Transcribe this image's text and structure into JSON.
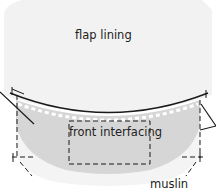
{
  "diagram": {
    "type": "sewing-pattern-illustration",
    "labels": {
      "flap_lining": "flap lining",
      "front_interfacing": "front interfacing",
      "muslin": "muslin"
    },
    "colors": {
      "background": "#ffffff",
      "flap_lining_fill": "#f2f2f2",
      "interfacing_fill": "#d6d6d6",
      "muslin_fill": "#f4f4f4",
      "line": "#1a1a1a"
    }
  }
}
